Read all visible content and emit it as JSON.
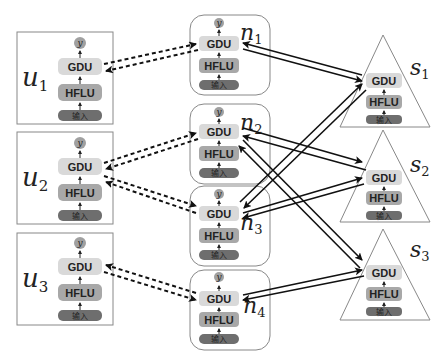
{
  "diagram": {
    "type": "federated-learning-architecture",
    "block_labels": {
      "output": "y",
      "gdu": "GDU",
      "hflu": "HFLU",
      "input": "输入"
    },
    "users": [
      {
        "id": "u1",
        "label": "u",
        "sub": "1"
      },
      {
        "id": "u2",
        "label": "u",
        "sub": "2"
      },
      {
        "id": "u3",
        "label": "u",
        "sub": "3"
      }
    ],
    "nodes": [
      {
        "id": "n1",
        "label": "n",
        "sub": "1"
      },
      {
        "id": "n2",
        "label": "n",
        "sub": "2"
      },
      {
        "id": "n3",
        "label": "n",
        "sub": "3"
      },
      {
        "id": "n4",
        "label": "n",
        "sub": "4"
      }
    ],
    "servers": [
      {
        "id": "s1",
        "label": "s",
        "sub": "1"
      },
      {
        "id": "s2",
        "label": "s",
        "sub": "2"
      },
      {
        "id": "s3",
        "label": "s",
        "sub": "3"
      }
    ],
    "edges_dashed_bidirectional": [
      [
        "u1",
        "n1"
      ],
      [
        "u2",
        "n2"
      ],
      [
        "u2",
        "n3"
      ],
      [
        "u3",
        "n4"
      ]
    ],
    "edges_solid_bidirectional": [
      [
        "n1",
        "s1"
      ],
      [
        "n2",
        "s2"
      ],
      [
        "n2",
        "s3"
      ],
      [
        "n3",
        "s1"
      ],
      [
        "n3",
        "s2"
      ],
      [
        "n4",
        "s3"
      ]
    ],
    "colors": {
      "gdu": "#d9d9d9",
      "hflu": "#a8a8a8",
      "input": "#6e6e6e",
      "output": "#a0a0a0",
      "border": "#888888",
      "arrow": "#111111"
    }
  }
}
